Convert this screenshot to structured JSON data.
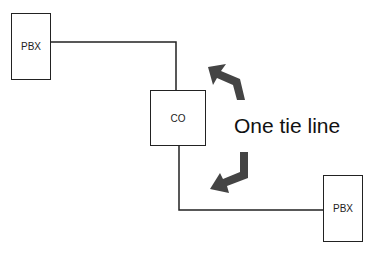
{
  "diagram": {
    "nodes": [
      {
        "id": "pbx-left",
        "label": "PBX"
      },
      {
        "id": "co",
        "label": "CO"
      },
      {
        "id": "pbx-right",
        "label": "PBX"
      }
    ],
    "edges": [
      {
        "from": "pbx-left",
        "to": "co"
      },
      {
        "from": "co",
        "to": "pbx-right"
      }
    ],
    "annotation": "One tie line",
    "colors": {
      "stroke": "#222222",
      "arrow": "#444444",
      "background": "#ffffff"
    }
  }
}
